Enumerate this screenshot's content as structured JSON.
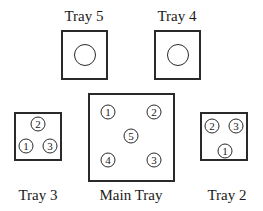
{
  "trays": {
    "tray5": {
      "label": "Tray 5",
      "contents": "empty"
    },
    "tray4": {
      "label": "Tray 4",
      "contents": "empty"
    },
    "tray3": {
      "label": "Tray 3",
      "chips": [
        "2",
        "1",
        "3"
      ]
    },
    "main": {
      "label": "Main Tray",
      "chips": [
        "1",
        "2",
        "5",
        "4",
        "3"
      ]
    },
    "tray2": {
      "label": "Tray 2",
      "chips": [
        "2",
        "3",
        "1"
      ]
    }
  },
  "colors": {
    "stroke": "#2a2a2a",
    "background": "#ffffff",
    "text": "#1a1a1a"
  }
}
